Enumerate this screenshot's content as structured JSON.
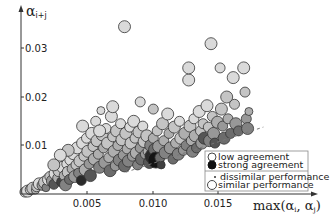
{
  "chart_data": {
    "type": "scatter",
    "title": "",
    "xlabel": "max(αi, αj)",
    "ylabel": "αi+j",
    "x_ticks": [
      "0.005",
      "0.010",
      "0.015"
    ],
    "y_ticks": [
      "0.01",
      "0.02",
      "0.03"
    ],
    "xlim": [
      0,
      0.0185
    ],
    "ylim": [
      0,
      0.0355
    ],
    "grid": false,
    "legend_position": "lower right",
    "legend": [
      {
        "label": "low agreement",
        "marker": "hollow-circle"
      },
      {
        "label": "strong agreement",
        "marker": "filled-black-circle"
      },
      {
        "label": "dissimilar performance",
        "marker": "small-dot"
      },
      {
        "label": "similar performance",
        "marker": "large-circle"
      }
    ],
    "reference_line": {
      "style": "dashed",
      "from": [
        0.008,
        0.0045
      ],
      "to": [
        0.0185,
        0.0138
      ]
    },
    "series": [
      {
        "name": "points",
        "points": [
          [
            0.0003,
            0.0004,
            5,
            0.1
          ],
          [
            0.0005,
            0.0006,
            6,
            0.1
          ],
          [
            0.0007,
            0.0009,
            5,
            0.2
          ],
          [
            0.0009,
            0.0012,
            6,
            0.2
          ],
          [
            0.0011,
            0.0008,
            4,
            0.3
          ],
          [
            0.0012,
            0.0015,
            5,
            0.2
          ],
          [
            0.0014,
            0.0021,
            6,
            0.1
          ],
          [
            0.0016,
            0.0018,
            5,
            0.4
          ],
          [
            0.0018,
            0.0024,
            6,
            0.2
          ],
          [
            0.0019,
            0.0013,
            4,
            0.5
          ],
          [
            0.0021,
            0.003,
            6,
            0.1
          ],
          [
            0.0022,
            0.0036,
            5,
            0.2
          ],
          [
            0.0024,
            0.0027,
            6,
            0.4
          ],
          [
            0.0025,
            0.002,
            5,
            0.7
          ],
          [
            0.0026,
            0.0042,
            6,
            0.1
          ],
          [
            0.0028,
            0.0033,
            5,
            0.3
          ],
          [
            0.0029,
            0.0048,
            6,
            0.2
          ],
          [
            0.0031,
            0.0025,
            5,
            0.8
          ],
          [
            0.0032,
            0.0055,
            6,
            0.1
          ],
          [
            0.0033,
            0.0038,
            5,
            0.3
          ],
          [
            0.0034,
            0.0019,
            6,
            0.5
          ],
          [
            0.0035,
            0.0062,
            5,
            0.1
          ],
          [
            0.0036,
            0.0045,
            6,
            0.2
          ],
          [
            0.0037,
            0.003,
            5,
            0.6
          ],
          [
            0.0038,
            0.0071,
            6,
            0.1
          ],
          [
            0.0039,
            0.0052,
            5,
            0.3
          ],
          [
            0.004,
            0.0083,
            6,
            0.1
          ],
          [
            0.0041,
            0.0036,
            6,
            0.4
          ],
          [
            0.0042,
            0.006,
            5,
            0.2
          ],
          [
            0.0043,
            0.0095,
            6,
            0.1
          ],
          [
            0.0044,
            0.0043,
            5,
            0.5
          ],
          [
            0.0045,
            0.0068,
            6,
            0.2
          ],
          [
            0.0046,
            0.0028,
            5,
            0.9
          ],
          [
            0.0047,
            0.0105,
            6,
            0.1
          ],
          [
            0.0048,
            0.0078,
            5,
            0.2
          ],
          [
            0.0049,
            0.005,
            6,
            0.3
          ],
          [
            0.005,
            0.0115,
            5,
            0.1
          ],
          [
            0.0051,
            0.0088,
            6,
            0.2
          ],
          [
            0.0052,
            0.0062,
            5,
            0.4
          ],
          [
            0.0053,
            0.0038,
            6,
            0.7
          ],
          [
            0.0054,
            0.0125,
            6,
            0.1
          ],
          [
            0.0055,
            0.0098,
            5,
            0.2
          ],
          [
            0.0056,
            0.0072,
            6,
            0.3
          ],
          [
            0.0057,
            0.015,
            5,
            0.1
          ],
          [
            0.0058,
            0.011,
            6,
            0.2
          ],
          [
            0.0059,
            0.0082,
            5,
            0.3
          ],
          [
            0.006,
            0.0055,
            6,
            0.5
          ],
          [
            0.0061,
            0.0172,
            4,
            0.1
          ],
          [
            0.0062,
            0.0122,
            6,
            0.2
          ],
          [
            0.0063,
            0.0095,
            5,
            0.3
          ],
          [
            0.0064,
            0.0065,
            6,
            0.4
          ],
          [
            0.0065,
            0.0135,
            5,
            0.1
          ],
          [
            0.0066,
            0.0105,
            6,
            0.2
          ],
          [
            0.0067,
            0.0075,
            5,
            0.3
          ],
          [
            0.0068,
            0.0048,
            6,
            0.6
          ],
          [
            0.0069,
            0.016,
            6,
            0.1
          ],
          [
            0.007,
            0.0118,
            5,
            0.2
          ],
          [
            0.0071,
            0.0088,
            6,
            0.3
          ],
          [
            0.0072,
            0.0058,
            5,
            0.4
          ],
          [
            0.0073,
            0.013,
            6,
            0.2
          ],
          [
            0.0074,
            0.01,
            5,
            0.3
          ],
          [
            0.0075,
            0.007,
            6,
            0.5
          ],
          [
            0.0076,
            0.0145,
            5,
            0.1
          ],
          [
            0.0077,
            0.0112,
            6,
            0.2
          ],
          [
            0.0078,
            0.008,
            5,
            0.4
          ],
          [
            0.0079,
            0.0058,
            6,
            0.6
          ],
          [
            0.008,
            0.0125,
            6,
            0.2
          ],
          [
            0.0081,
            0.0093,
            5,
            0.3
          ],
          [
            0.0082,
            0.0068,
            6,
            0.5
          ],
          [
            0.0083,
            0.0138,
            5,
            0.1
          ],
          [
            0.0084,
            0.0105,
            6,
            0.2
          ],
          [
            0.0085,
            0.0078,
            5,
            0.4
          ],
          [
            0.0086,
            0.015,
            6,
            0.1
          ],
          [
            0.0087,
            0.0115,
            5,
            0.2
          ],
          [
            0.0088,
            0.0085,
            6,
            0.3
          ],
          [
            0.0089,
            0.006,
            5,
            0.5
          ],
          [
            0.009,
            0.0128,
            6,
            0.2
          ],
          [
            0.0091,
            0.0095,
            5,
            0.4
          ],
          [
            0.0092,
            0.0072,
            6,
            0.6
          ],
          [
            0.0093,
            0.014,
            5,
            0.1
          ],
          [
            0.0094,
            0.0108,
            6,
            0.2
          ],
          [
            0.0095,
            0.0082,
            5,
            0.4
          ],
          [
            0.0096,
            0.012,
            6,
            0.2
          ],
          [
            0.0097,
            0.0088,
            5,
            0.3
          ],
          [
            0.0098,
            0.0065,
            6,
            0.7
          ],
          [
            0.0099,
            0.01,
            6,
            0.5
          ],
          [
            0.01,
            0.0078,
            7,
            0.9
          ],
          [
            0.0101,
            0.0115,
            5,
            0.3
          ],
          [
            0.0102,
            0.0092,
            6,
            0.6
          ],
          [
            0.0103,
            0.007,
            8,
            1.0
          ],
          [
            0.0104,
            0.013,
            5,
            0.2
          ],
          [
            0.0105,
            0.0098,
            6,
            0.4
          ],
          [
            0.0106,
            0.0075,
            5,
            0.6
          ],
          [
            0.0107,
            0.006,
            4,
            0.8
          ],
          [
            0.0108,
            0.0145,
            6,
            0.2
          ],
          [
            0.0109,
            0.011,
            5,
            0.3
          ],
          [
            0.011,
            0.0085,
            6,
            0.5
          ],
          [
            0.0112,
            0.0165,
            6,
            0.1
          ],
          [
            0.0113,
            0.0125,
            5,
            0.3
          ],
          [
            0.0114,
            0.0095,
            6,
            0.4
          ],
          [
            0.0116,
            0.0072,
            5,
            0.6
          ],
          [
            0.0117,
            0.0138,
            6,
            0.2
          ],
          [
            0.0118,
            0.0105,
            5,
            0.3
          ],
          [
            0.012,
            0.0082,
            6,
            0.5
          ],
          [
            0.0121,
            0.015,
            5,
            0.1
          ],
          [
            0.0122,
            0.0115,
            6,
            0.2
          ],
          [
            0.0124,
            0.009,
            5,
            0.4
          ],
          [
            0.0125,
            0.0125,
            6,
            0.3
          ],
          [
            0.0126,
            0.01,
            5,
            0.5
          ],
          [
            0.0128,
            0.0235,
            6,
            0.1
          ],
          [
            0.0129,
            0.014,
            6,
            0.2
          ],
          [
            0.013,
            0.011,
            5,
            0.3
          ],
          [
            0.0131,
            0.0088,
            6,
            0.5
          ],
          [
            0.0132,
            0.0155,
            5,
            0.1
          ],
          [
            0.0133,
            0.012,
            6,
            0.3
          ],
          [
            0.0134,
            0.0095,
            5,
            0.6
          ],
          [
            0.0136,
            0.017,
            6,
            0.1
          ],
          [
            0.0137,
            0.013,
            5,
            0.2
          ],
          [
            0.0138,
            0.0105,
            6,
            0.4
          ],
          [
            0.0139,
            0.0145,
            5,
            0.2
          ],
          [
            0.014,
            0.0115,
            6,
            0.7
          ],
          [
            0.0142,
            0.0182,
            6,
            0.1
          ],
          [
            0.0143,
            0.0138,
            5,
            0.2
          ],
          [
            0.0144,
            0.011,
            6,
            0.5
          ],
          [
            0.0145,
            0.031,
            6,
            0.1
          ],
          [
            0.0146,
            0.016,
            5,
            0.2
          ],
          [
            0.0147,
            0.0125,
            6,
            0.4
          ],
          [
            0.0148,
            0.0105,
            5,
            0.7
          ],
          [
            0.015,
            0.0148,
            6,
            0.3
          ],
          [
            0.0152,
            0.026,
            5,
            0.1
          ],
          [
            0.0153,
            0.0175,
            6,
            0.2
          ],
          [
            0.0154,
            0.014,
            5,
            0.4
          ],
          [
            0.0155,
            0.0115,
            6,
            0.6
          ],
          [
            0.0157,
            0.02,
            6,
            0.2
          ],
          [
            0.0158,
            0.0155,
            5,
            0.3
          ],
          [
            0.016,
            0.0125,
            5,
            0.6
          ],
          [
            0.0162,
            0.024,
            6,
            0.1
          ],
          [
            0.0163,
            0.0185,
            5,
            0.2
          ],
          [
            0.0164,
            0.0145,
            6,
            0.4
          ],
          [
            0.0166,
            0.013,
            5,
            0.6
          ],
          [
            0.017,
            0.026,
            6,
            0.1
          ],
          [
            0.0171,
            0.021,
            5,
            0.2
          ],
          [
            0.0172,
            0.0155,
            5,
            0.4
          ],
          [
            0.0173,
            0.0135,
            6,
            0.5
          ],
          [
            0.0174,
            0.017,
            4,
            0.3
          ],
          [
            0.006,
            0.013,
            6,
            0.1
          ],
          [
            0.0047,
            0.014,
            6,
            0.1
          ],
          [
            0.0036,
            0.009,
            6,
            0.2
          ],
          [
            0.003,
            0.008,
            6,
            0.1
          ],
          [
            0.0025,
            0.006,
            6,
            0.2
          ],
          [
            0.0079,
            0.0345,
            6,
            0.1
          ],
          [
            0.0091,
            0.019,
            5,
            0.1
          ],
          [
            0.007,
            0.018,
            6,
            0.1
          ],
          [
            0.0101,
            0.0175,
            5,
            0.2
          ],
          [
            0.0128,
            0.026,
            6,
            0.1
          ]
        ]
      }
    ]
  }
}
